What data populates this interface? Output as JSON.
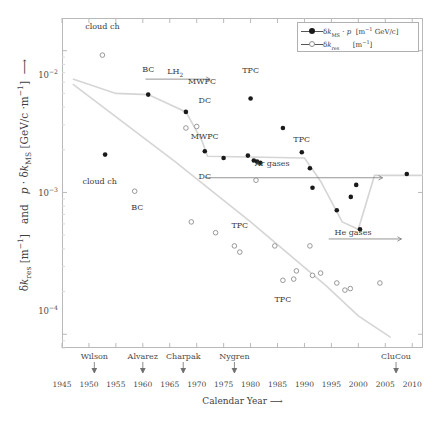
{
  "chart_data": {
    "type": "scatter",
    "title": "",
    "xlabel": "Calendar Year ⟶",
    "ylabel": "δk_res [m⁻¹]  and  p · δk_MS [GeV/c ·m⁻¹] ⟶",
    "xlim": [
      1945,
      2012
    ],
    "ylim": [
      8e-05,
      0.017
    ],
    "yscale": "log",
    "grid": false,
    "legend_position": "top-right",
    "xticks": [
      1945,
      1950,
      1955,
      1960,
      1965,
      1970,
      1975,
      1980,
      1985,
      1990,
      1995,
      2000,
      2005,
      2010
    ],
    "yticks": [
      "10⁻²",
      "10⁻³",
      "10⁻⁴"
    ],
    "ytick_values": [
      0.01,
      0.001,
      0.0001
    ],
    "series": [
      {
        "name": "δk_MS · p [m⁻¹ GeV/c]",
        "marker": "filled-circle",
        "color": "#1a1a1a",
        "points": [
          {
            "x": 1953,
            "y": 0.00185
          },
          {
            "x": 1961,
            "y": 0.0049
          },
          {
            "x": 1968,
            "y": 0.0037
          },
          {
            "x": 1971.5,
            "y": 0.00195
          },
          {
            "x": 1975,
            "y": 0.00175
          },
          {
            "x": 1979.5,
            "y": 0.00182
          },
          {
            "x": 1980.6,
            "y": 0.00168
          },
          {
            "x": 1981.2,
            "y": 0.00165
          },
          {
            "x": 1981.8,
            "y": 0.00162
          },
          {
            "x": 1980,
            "y": 0.0046
          },
          {
            "x": 1986,
            "y": 0.00285
          },
          {
            "x": 1989.5,
            "y": 0.00192
          },
          {
            "x": 1991,
            "y": 0.00148
          },
          {
            "x": 1991.5,
            "y": 0.00108
          },
          {
            "x": 1996,
            "y": 0.00075
          },
          {
            "x": 1998.6,
            "y": 0.00093
          },
          {
            "x": 1999.6,
            "y": 0.00113
          },
          {
            "x": 2000.3,
            "y": 0.00055
          },
          {
            "x": 2009,
            "y": 0.00135
          }
        ]
      },
      {
        "name": "δk_res [m⁻¹]",
        "marker": "open-circle",
        "color": "#8d8d8d",
        "points": [
          {
            "x": 1952.5,
            "y": 0.0093
          },
          {
            "x": 1958.5,
            "y": 0.00102
          },
          {
            "x": 1968,
            "y": 0.00285
          },
          {
            "x": 1970,
            "y": 0.00292
          },
          {
            "x": 1969,
            "y": 0.00062
          },
          {
            "x": 1973.5,
            "y": 0.00052
          },
          {
            "x": 1977,
            "y": 0.00042
          },
          {
            "x": 1978,
            "y": 0.00038
          },
          {
            "x": 1981,
            "y": 0.00122
          },
          {
            "x": 1984.5,
            "y": 0.00042
          },
          {
            "x": 1988.5,
            "y": 0.00028
          },
          {
            "x": 1991,
            "y": 0.00042
          },
          {
            "x": 1991.5,
            "y": 0.00026
          },
          {
            "x": 1993,
            "y": 0.00027
          },
          {
            "x": 1996,
            "y": 0.00023
          },
          {
            "x": 1997.5,
            "y": 0.000205
          },
          {
            "x": 1988,
            "y": 0.000245
          },
          {
            "x": 1998.5,
            "y": 0.00021
          },
          {
            "x": 2004,
            "y": 0.00023
          },
          {
            "x": 1986,
            "y": 0.00024
          }
        ]
      }
    ],
    "annotations": [
      {
        "text": "cloud ch",
        "x": 1952.5,
        "y": 0.0148
      },
      {
        "text": "cloud ch",
        "x": 1952,
        "y": 0.00118
      },
      {
        "text": "BC",
        "x": 1961,
        "y": 0.0073
      },
      {
        "text": "BC",
        "x": 1959,
        "y": 0.00078
      },
      {
        "text": "LH2",
        "x": 1966,
        "y": 0.0071
      },
      {
        "text": "MWPC",
        "x": 1971,
        "y": 0.006
      },
      {
        "text": "MWPC",
        "x": 1971.5,
        "y": 0.00245
      },
      {
        "text": "DC",
        "x": 1971.5,
        "y": 0.0044
      },
      {
        "text": "DC",
        "x": 1971.5,
        "y": 0.00128
      },
      {
        "text": "TPC",
        "x": 1980,
        "y": 0.0072
      },
      {
        "text": "TPC",
        "x": 1989.5,
        "y": 0.00235
      },
      {
        "text": "TPC",
        "x": 1978,
        "y": 0.00058
      },
      {
        "text": "TPC",
        "x": 1986,
        "y": 0.000175
      },
      {
        "text": "Ar gases",
        "x": 1984,
        "y": 0.00158
      },
      {
        "text": "He gases",
        "x": 1999,
        "y": 0.00052
      }
    ],
    "arrows": [
      {
        "label": "LH2-range",
        "x0": 1960.5,
        "x1": 1972.5,
        "y": 0.0063
      },
      {
        "label": "Ar-gases-range",
        "x0": 1971.5,
        "x1": 2004.5,
        "y": 0.00127
      },
      {
        "label": "He-gases-range",
        "x0": 1994.5,
        "x1": 2008.0,
        "y": 0.00047
      }
    ],
    "trend_curves": [
      {
        "name": "ms-trend",
        "color": "#d5d5d5",
        "points": [
          [
            1947,
            0.0063
          ],
          [
            1955,
            0.005
          ],
          [
            1961,
            0.0049
          ],
          [
            1968,
            0.0037
          ],
          [
            1971,
            0.0023
          ],
          [
            1972,
            0.0018
          ],
          [
            1990,
            0.00175
          ],
          [
            1993,
            0.0012
          ],
          [
            1997,
            0.00062
          ],
          [
            2000,
            0.00055
          ],
          [
            2003,
            0.00132
          ],
          [
            2012,
            0.00132
          ]
        ]
      },
      {
        "name": "res-trend",
        "color": "#d5d5d5",
        "points": [
          [
            1947,
            0.0058
          ],
          [
            1966,
            0.00165
          ],
          [
            1980,
            0.00062
          ],
          [
            1994,
            0.00022
          ],
          [
            2000,
            0.000135
          ],
          [
            2006,
            9.5e-05
          ]
        ]
      }
    ],
    "person_markers": [
      {
        "name": "Wilson",
        "x": 1951
      },
      {
        "name": "Alvarez",
        "x": 1960
      },
      {
        "name": "Charpak",
        "x": 1967.5
      },
      {
        "name": "Nygren",
        "x": 1977
      },
      {
        "name": "CluCou",
        "x": 2007
      }
    ]
  },
  "legend": {
    "entries": [
      {
        "label_sym": "δk",
        "label_sub": "MS",
        "label_rest": " · p",
        "units": "[m⁻¹ GeV/c]",
        "marker": "filled-circle"
      },
      {
        "label_sym": "δk",
        "label_sub": "res",
        "label_rest": "",
        "units": "[m⁻¹]",
        "marker": "open-circle"
      }
    ]
  },
  "axes": {
    "x_title": "Calendar Year ⟶",
    "y_title_a": "δk",
    "y_title_a_sub": "res",
    "y_title_a_units": " [m⁻¹]",
    "y_title_and": "  and  ",
    "y_title_b": "p · δk",
    "y_title_b_sub": "MS",
    "y_title_b_units": " [GeV/c ·m⁻¹]  ⟶"
  }
}
